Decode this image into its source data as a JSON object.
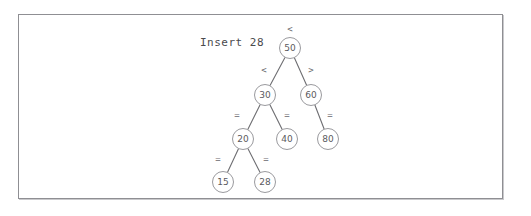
{
  "figure": {
    "caption": "Insert 28",
    "frame_color": "#8f8f93",
    "node_stroke_color": "#9a9a9e",
    "edge_color": "#6e6e72",
    "text_color": "#5a5a5e"
  },
  "chart_data": {
    "type": "diagram",
    "diagram_type": "binary-search-tree",
    "title": "Insert 28",
    "nodes": [
      {
        "id": "n50",
        "label": "50",
        "x": 290,
        "y": 48,
        "level": 0
      },
      {
        "id": "n30",
        "label": "30",
        "x": 265,
        "y": 95,
        "level": 1
      },
      {
        "id": "n60",
        "label": "60",
        "x": 311,
        "y": 95,
        "level": 1
      },
      {
        "id": "n20",
        "label": "20",
        "x": 243,
        "y": 139,
        "level": 2
      },
      {
        "id": "n40",
        "label": "40",
        "x": 287,
        "y": 139,
        "level": 2
      },
      {
        "id": "n80",
        "label": "80",
        "x": 328,
        "y": 139,
        "level": 2
      },
      {
        "id": "n15",
        "label": "15",
        "x": 223,
        "y": 182,
        "level": 3
      },
      {
        "id": "n28",
        "label": "28",
        "x": 265,
        "y": 182,
        "level": 3
      }
    ],
    "edges": [
      {
        "from": "n50",
        "to": "n30",
        "label": "<",
        "lx": 264,
        "ly": 70
      },
      {
        "from": "n50",
        "to": "n60",
        "label": ">",
        "lx": 311,
        "ly": 70
      },
      {
        "from": "n30",
        "to": "n20",
        "label": "=",
        "lx": 237,
        "ly": 115
      },
      {
        "from": "n30",
        "to": "n40",
        "label": "=",
        "lx": 287,
        "ly": 115
      },
      {
        "from": "n60",
        "to": "n80",
        "label": "=",
        "lx": 330,
        "ly": 115
      },
      {
        "from": "n20",
        "to": "n15",
        "label": "=",
        "lx": 218,
        "ly": 159
      },
      {
        "from": "n20",
        "to": "n28",
        "label": "=",
        "lx": 266,
        "ly": 159
      }
    ],
    "root_label": {
      "text": "<",
      "x": 290,
      "y": 29
    },
    "caption_position": {
      "x": 200,
      "y": 44
    },
    "values": [
      50,
      30,
      60,
      20,
      40,
      80,
      15,
      28
    ],
    "inserted_value": 28
  }
}
